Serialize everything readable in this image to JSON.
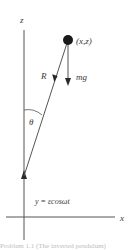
{
  "diagram": {
    "type": "physics free-body diagram (inverted pendulum with oscillating pivot)",
    "axes": {
      "vertical_label": "z",
      "horizontal_label": "x"
    },
    "mass": {
      "label": "(x,z)"
    },
    "forces": {
      "rod_force_label": "R",
      "gravity_label": "mg"
    },
    "angle_label": "θ",
    "pivot_motion_label": "y = εcosωt"
  },
  "caption": {
    "text": "Problem 1.1 (The inverted pendulum)"
  },
  "colors": {
    "line": "#4a4a4a",
    "mass_fill": "#1a1a1a",
    "text": "#3a3a3a",
    "background": "#ffffff"
  }
}
